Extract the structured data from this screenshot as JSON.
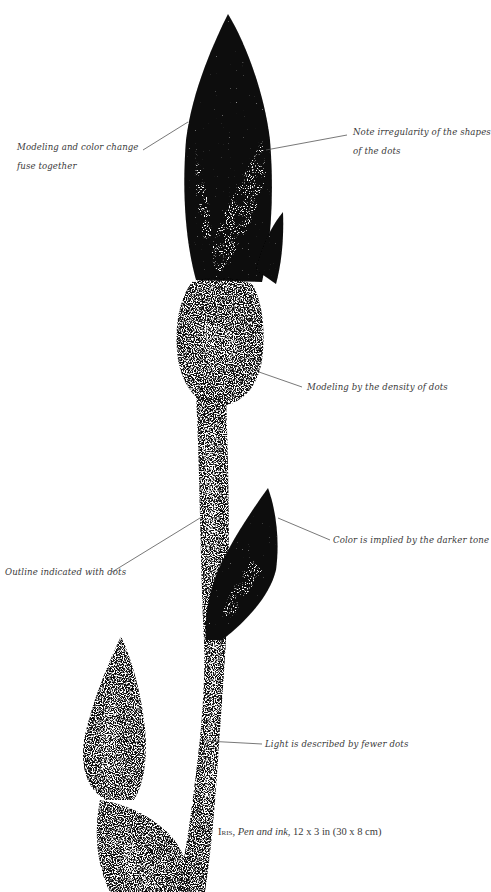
{
  "annotations": {
    "modeling_color": {
      "line1": "Modeling and color change",
      "line2": "fuse together"
    },
    "irregularity": {
      "line1": "Note irregularity of the shapes",
      "line2": "of the dots"
    },
    "density": {
      "text": "Modeling by the density of dots"
    },
    "color_implied": {
      "text": "Color is implied by the darker tone"
    },
    "outline": {
      "text": "Outline indicated with dots"
    },
    "light": {
      "text": "Light is described by fewer dots"
    }
  },
  "caption": {
    "title": "Iris,",
    "medium": "Pen and ink,",
    "dimensions": "12 x 3 in (30 x 8 cm)"
  },
  "illustration": {
    "subject": "iris-bud-stipple-drawing",
    "ink_color": "#0a0a0a",
    "leader_line_color": "#555555"
  }
}
